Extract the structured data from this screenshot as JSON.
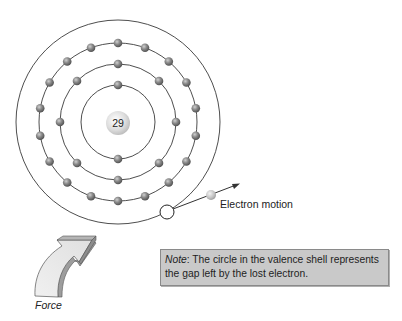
{
  "diagram": {
    "nucleus": {
      "label": "29",
      "cx": 118,
      "cy": 123,
      "r": 12
    },
    "shells": [
      {
        "name": "shell-1",
        "r": 37,
        "electrons": 2
      },
      {
        "name": "shell-2",
        "r": 58,
        "electrons": 8
      },
      {
        "name": "shell-3",
        "r": 79,
        "electrons": 18
      },
      {
        "name": "valence-shell",
        "r": 102,
        "electrons": 0
      }
    ],
    "hole": {
      "cx": 167,
      "cy": 212,
      "r": 7
    },
    "free_electron": {
      "cx": 211,
      "cy": 195,
      "r": 5
    }
  },
  "labels": {
    "electron_motion": "Electron motion",
    "force": "Force"
  },
  "note": {
    "key": "Note",
    "text": ": The circle in the valence shell represents the gap left by the lost electron."
  },
  "colors": {
    "note_bg": "#c9c9c9",
    "line": "#333333",
    "electron": "#7a7a7a",
    "nucleus": "#d9d9d9"
  }
}
